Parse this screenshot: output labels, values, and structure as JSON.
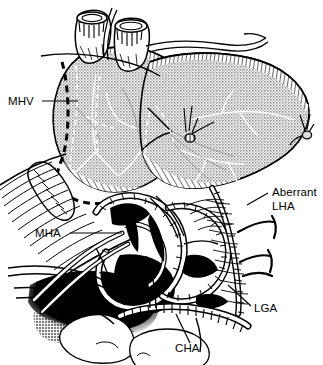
{
  "figure": {
    "style": "black-and-white medical line engraving with halftone stipple shading",
    "width": 323,
    "height": 365,
    "background_color": "#ffffff",
    "ink_color": "#000000",
    "parenchyma_tone_color": "#9a9a9a",
    "shadow_color": "#000000"
  },
  "labels": [
    {
      "id": "mhv",
      "text": "MHV",
      "meaning": "Middle hepatic vein",
      "text_x": 8,
      "text_y": 105,
      "anchor": "start",
      "leader": {
        "x1": 42,
        "y1": 101,
        "x2": 78,
        "y2": 101
      }
    },
    {
      "id": "mha",
      "text": "MHA",
      "meaning": "Middle hepatic artery",
      "text_x": 35,
      "text_y": 237,
      "anchor": "start",
      "leader": {
        "x1": 70,
        "y1": 233,
        "x2": 122,
        "y2": 233
      }
    },
    {
      "id": "aberrant-lha-line1",
      "text": "Aberrant",
      "meaning": "Aberrant left hepatic artery (line 1)",
      "text_x": 272,
      "text_y": 196,
      "anchor": "start",
      "leader": {
        "x1": 268,
        "y1": 193,
        "x2": 247,
        "y2": 205
      }
    },
    {
      "id": "aberrant-lha-line2",
      "text": "LHA",
      "meaning": "Aberrant left hepatic artery (line 2)",
      "text_x": 272,
      "text_y": 210,
      "anchor": "start",
      "leader": null
    },
    {
      "id": "lga",
      "text": "LGA",
      "meaning": "Left gastric artery",
      "text_x": 254,
      "text_y": 312,
      "anchor": "start",
      "leader": {
        "x1": 251,
        "y1": 306,
        "x2": 228,
        "y2": 285
      }
    },
    {
      "id": "cha",
      "text": "CHA",
      "meaning": "Common hepatic artery",
      "text_x": 175,
      "text_y": 352,
      "anchor": "start",
      "leader": {
        "x1": 190,
        "y1": 343,
        "x2": 176,
        "y2": 314
      }
    }
  ],
  "structures": [
    {
      "id": "ivc-stump",
      "name": "Inferior vena cava / hepatic vein stump",
      "region": "top-left"
    },
    {
      "id": "hepatic-vein-stump",
      "name": "Hepatic vein stump",
      "region": "top-center"
    },
    {
      "id": "right-lobe",
      "name": "Right hepatic lobe",
      "region": "center-left",
      "shading": "stipple"
    },
    {
      "id": "left-lateral-segment",
      "name": "Left lateral segment",
      "region": "center-right",
      "shading": "stipple"
    },
    {
      "id": "transection-plane",
      "name": "Parenchymal transection plane",
      "region": "left",
      "style": "bold-dashed"
    },
    {
      "id": "gallbladder",
      "name": "Gallbladder / cystic duct stump",
      "region": "mid-left"
    },
    {
      "id": "arterial-loop",
      "name": "Hepatic arterial loop",
      "region": "center-bottom"
    },
    {
      "id": "portal-shadow",
      "name": "Retrohepatic shadow cavity",
      "region": "bottom-left",
      "shading": "solid-black"
    },
    {
      "id": "ligature-clip",
      "name": "Suture ligature",
      "region": "center"
    },
    {
      "id": "vessel-tie-right",
      "name": "Tied vessel stump",
      "region": "right-edge"
    },
    {
      "id": "gastric-branches",
      "name": "Gastric arterial branches",
      "region": "right-edge"
    }
  ]
}
